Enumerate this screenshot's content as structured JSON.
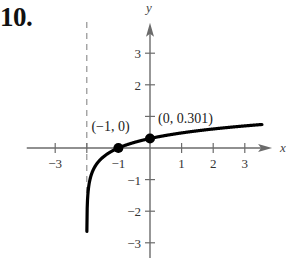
{
  "problem": {
    "number": "10."
  },
  "chart_data": {
    "type": "line",
    "title": "",
    "function": "y = log10(x + 2)",
    "xlabel": "x",
    "ylabel": "y",
    "xlim": [
      -3.9,
      3.8
    ],
    "ylim": [
      -3.5,
      3.9
    ],
    "grid": false,
    "x_ticks": [
      -3,
      -2,
      -1,
      1,
      2,
      3
    ],
    "x_tick_labels": [
      "−3",
      "−1",
      "1",
      "2",
      "3"
    ],
    "x_tick_labels_at": [
      -3,
      -1,
      1,
      2,
      3
    ],
    "y_ticks": [
      3,
      2,
      1,
      -1,
      -2,
      -3
    ],
    "y_tick_labels": [
      "3",
      "2",
      "−1",
      "−2",
      "−3"
    ],
    "y_tick_labels_at": [
      3,
      2,
      -1,
      -2,
      -3
    ],
    "asymptote": {
      "type": "vertical",
      "x": -2,
      "style": "dashed"
    },
    "points": [
      {
        "x": -1,
        "y": 0,
        "label": "(−1, 0)"
      },
      {
        "x": 0,
        "y": 0.301,
        "label": "(0, 0.301)"
      }
    ],
    "curve_samples": {
      "x": [
        -1.99,
        -1.95,
        -1.9,
        -1.8,
        -1.6,
        -1.4,
        -1.2,
        -1.0,
        -0.5,
        0,
        0.5,
        1,
        1.5,
        2,
        2.5,
        3,
        3.5
      ],
      "y": [
        -2.0,
        -1.3,
        -1.0,
        -0.699,
        -0.398,
        -0.222,
        -0.097,
        0.0,
        0.176,
        0.301,
        0.398,
        0.477,
        0.544,
        0.602,
        0.653,
        0.699,
        0.74
      ]
    }
  },
  "colors": {
    "axis": "#6b6b6b",
    "curve": "#000000",
    "asymptote": "#888888",
    "text": "#333333"
  }
}
